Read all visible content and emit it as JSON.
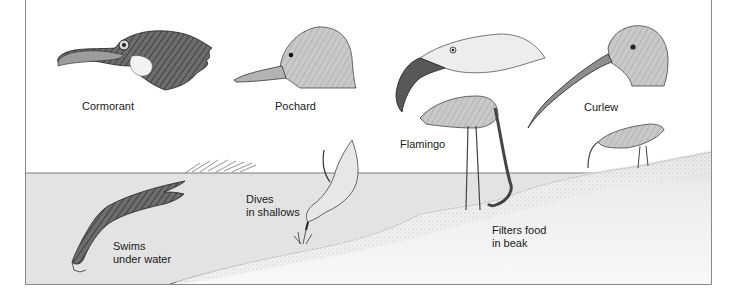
{
  "figure": {
    "colors": {
      "water": "#e3e3e3",
      "shore": "#f4f4f4",
      "frame": "#8a8a8a",
      "ink": "#1a1a1a"
    }
  },
  "heads": [
    {
      "id": "cormorant",
      "label": "Cormorant"
    },
    {
      "id": "pochard",
      "label": "Pochard"
    },
    {
      "id": "flamingo",
      "label": "Flamingo"
    },
    {
      "id": "curlew",
      "label": "Curlew"
    }
  ],
  "behaviours": [
    {
      "id": "cormorant",
      "line1": "Swims",
      "line2": "under water"
    },
    {
      "id": "pochard",
      "line1": "Dives",
      "line2": "in shallows"
    },
    {
      "id": "flamingo",
      "line1": "Filters food",
      "line2": "in beak"
    }
  ]
}
